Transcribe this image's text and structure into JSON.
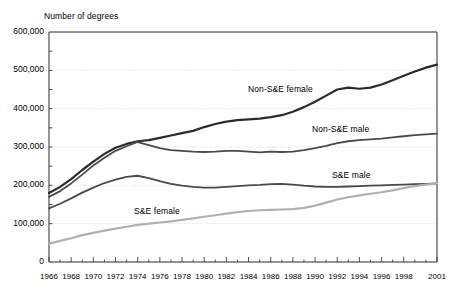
{
  "chart_data": {
    "type": "line",
    "title": "",
    "subtitle": "",
    "ylabel": "Number of degrees",
    "xlabel": "",
    "ylim": [
      0,
      600000
    ],
    "xlim": [
      1966,
      2001
    ],
    "grid": true,
    "grid_axis": "y",
    "legend_position": "inline-annotations",
    "ytick_labels": [
      "600,000",
      "500,000",
      "400,000",
      "300,000",
      "200,000",
      "100,000",
      "0"
    ],
    "ytick_values": [
      600000,
      500000,
      400000,
      300000,
      200000,
      100000,
      0
    ],
    "yminor_step": 50000,
    "xtick_labels": [
      "1966",
      "1968",
      "1970",
      "1972",
      "1974",
      "1976",
      "1978",
      "1980",
      "1982",
      "1984",
      "1986",
      "1988",
      "1990",
      "1992",
      "1994",
      "1996",
      "1998",
      "2001"
    ],
    "xtick_values": [
      1966,
      1968,
      1970,
      1972,
      1974,
      1976,
      1978,
      1980,
      1982,
      1984,
      1986,
      1988,
      1990,
      1992,
      1994,
      1996,
      1998,
      2001
    ],
    "x": [
      1966,
      1967,
      1968,
      1969,
      1970,
      1971,
      1972,
      1973,
      1974,
      1975,
      1976,
      1977,
      1978,
      1979,
      1980,
      1981,
      1982,
      1983,
      1984,
      1985,
      1986,
      1987,
      1988,
      1989,
      1990,
      1991,
      1992,
      1993,
      1994,
      1995,
      1996,
      1997,
      1998,
      1999,
      2000,
      2001
    ],
    "series": [
      {
        "name": "Non-S&E female",
        "color": "#2b2b2b",
        "width": 2.2,
        "values": [
          180000,
          196000,
          216000,
          240000,
          262000,
          282000,
          298000,
          308000,
          315000,
          318000,
          324000,
          330000,
          336000,
          342000,
          352000,
          360000,
          366000,
          370000,
          372000,
          374000,
          378000,
          383000,
          392000,
          404000,
          418000,
          434000,
          450000,
          455000,
          452000,
          455000,
          463000,
          474000,
          486000,
          497000,
          507000,
          515000
        ],
        "label_position": {
          "x": 248,
          "y": 84
        }
      },
      {
        "name": "Non-S&E male",
        "color": "#4a4a4a",
        "width": 1.8,
        "values": [
          170000,
          185000,
          205000,
          228000,
          252000,
          272000,
          290000,
          302000,
          313000,
          305000,
          297000,
          292000,
          290000,
          288000,
          287000,
          288000,
          290000,
          290000,
          288000,
          286000,
          288000,
          287000,
          288000,
          292000,
          297000,
          303000,
          310000,
          315000,
          318000,
          320000,
          322000,
          325000,
          328000,
          331000,
          333000,
          335000
        ],
        "label_position": {
          "x": 312,
          "y": 124
        }
      },
      {
        "name": "S&E male",
        "color": "#4a4a4a",
        "width": 1.8,
        "values": [
          140000,
          152000,
          166000,
          181000,
          194000,
          206000,
          215000,
          222000,
          225000,
          219000,
          211000,
          204000,
          199000,
          196000,
          194000,
          194000,
          196000,
          198000,
          200000,
          201000,
          203000,
          204000,
          202000,
          199000,
          197000,
          196000,
          196000,
          197000,
          198000,
          199000,
          200000,
          201000,
          202000,
          203000,
          204000,
          205000
        ],
        "label_position": {
          "x": 332,
          "y": 170
        }
      },
      {
        "name": "S&E female",
        "color": "#b0b0b0",
        "width": 2.2,
        "values": [
          48000,
          55000,
          62000,
          70000,
          76000,
          82000,
          87000,
          92000,
          97000,
          100000,
          103000,
          106000,
          110000,
          114000,
          118000,
          122000,
          126000,
          130000,
          133000,
          135000,
          136000,
          137000,
          138000,
          141000,
          147000,
          155000,
          163000,
          169000,
          174000,
          178000,
          182000,
          187000,
          193000,
          198000,
          202000,
          205000
        ],
        "label_position": {
          "x": 134,
          "y": 206
        }
      }
    ],
    "plot_area": {
      "left": 49,
      "top": 32,
      "right": 437,
      "bottom": 262
    },
    "colors": {
      "frame": "#2b2b2b",
      "gridline": "#c9c9c9",
      "background": "#ffffff",
      "text": "#000000"
    }
  }
}
